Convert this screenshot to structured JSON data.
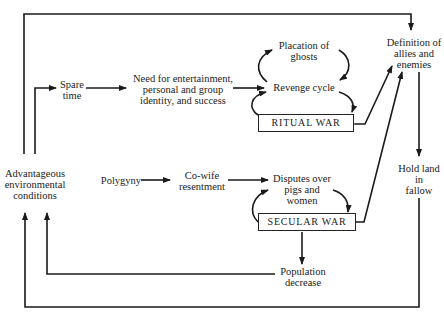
{
  "diagram": {
    "type": "flow-cycle",
    "nodes": {
      "advantageous": "Advantageous\nenvironmental\nconditions",
      "spare_time": "Spare\ntime",
      "need": "Need for entertainment,\npersonal and group\nidentity, and success",
      "placation": "Placation of\nghosts",
      "revenge": "Revenge cycle",
      "ritual_war": "RITUAL  WAR",
      "definition": "Definition of\nallies and\nenemies",
      "hold_land": "Hold land\nin\nfallow",
      "polygyny": "Polygyny",
      "cowife": "Co-wife\nresentment",
      "disputes": "Disputes over\npigs and\nwomen",
      "secular_war": "SECULAR  WAR",
      "population": "Population\ndecrease"
    },
    "edges": [
      {
        "from": "advantageous",
        "to": "spare_time"
      },
      {
        "from": "spare_time",
        "to": "need"
      },
      {
        "from": "need",
        "to": "revenge"
      },
      {
        "from": "revenge",
        "to": "placation"
      },
      {
        "from": "placation",
        "to": "revenge"
      },
      {
        "from": "revenge",
        "to": "ritual_war"
      },
      {
        "from": "ritual_war",
        "to": "revenge"
      },
      {
        "from": "ritual_war",
        "to": "definition",
        "bidirectional": true
      },
      {
        "from": "secular_war",
        "to": "definition",
        "bidirectional": true
      },
      {
        "from": "advantageous",
        "to": "definition"
      },
      {
        "from": "definition",
        "to": "hold_land"
      },
      {
        "from": "hold_land",
        "to": "advantageous"
      },
      {
        "from": "polygyny",
        "to": "cowife"
      },
      {
        "from": "cowife",
        "to": "disputes"
      },
      {
        "from": "disputes",
        "to": "secular_war"
      },
      {
        "from": "secular_war",
        "to": "disputes"
      },
      {
        "from": "secular_war",
        "to": "population"
      },
      {
        "from": "population",
        "to": "advantageous"
      }
    ]
  }
}
